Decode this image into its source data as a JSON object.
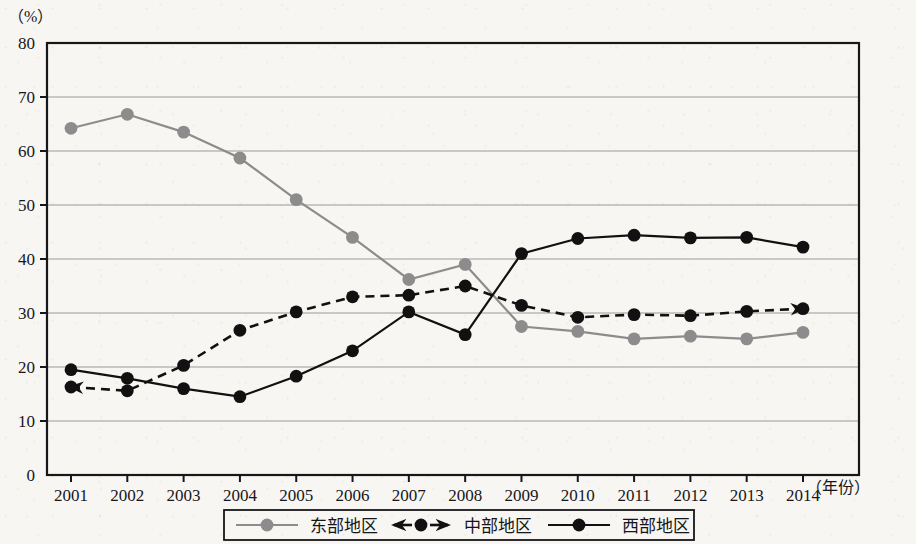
{
  "axes": {
    "y_unit": "（%）",
    "x_unit": "（年份）",
    "y_ticks": [
      "80",
      "70",
      "60",
      "50",
      "40",
      "30",
      "20",
      "10",
      "0"
    ],
    "x_ticks": [
      "2001",
      "2002",
      "2003",
      "2004",
      "2005",
      "2006",
      "2007",
      "2008",
      "2009",
      "2010",
      "2011",
      "2012",
      "2013",
      "2014"
    ]
  },
  "legend": {
    "items": [
      {
        "label": "东部地区",
        "color": "#8c8c8c",
        "style": "solid-gray-dot"
      },
      {
        "label": "中部地区",
        "color": "#111111",
        "style": "dashed-black-dot-arrows"
      },
      {
        "label": "西部地区",
        "color": "#111111",
        "style": "solid-black-dot"
      }
    ]
  },
  "colors": {
    "east": "#8c8c8c",
    "center": "#111111",
    "west": "#111111",
    "grid": "#9a9a9a",
    "frame": "#17171a",
    "paper": "#f7f6f3"
  },
  "chart_data": {
    "type": "line",
    "title": "",
    "xlabel": "年份",
    "ylabel": "%",
    "categories": [
      "2001",
      "2002",
      "2003",
      "2004",
      "2005",
      "2006",
      "2007",
      "2008",
      "2009",
      "2010",
      "2011",
      "2012",
      "2013",
      "2014"
    ],
    "ylim": [
      0,
      80
    ],
    "ytick_step": 10,
    "grid": true,
    "legend_position": "bottom",
    "series": [
      {
        "name": "东部地区",
        "color": "#8c8c8c",
        "line": "solid",
        "marker": "circle",
        "values": [
          64.2,
          66.8,
          63.5,
          58.7,
          51.0,
          44.0,
          36.2,
          39.0,
          27.5,
          26.6,
          25.2,
          25.7,
          25.2,
          26.4
        ]
      },
      {
        "name": "中部地区",
        "color": "#111111",
        "line": "dashed",
        "marker": "circle",
        "arrow_start": true,
        "arrow_end": true,
        "values": [
          16.3,
          15.6,
          20.3,
          26.8,
          30.2,
          33.0,
          33.3,
          35.0,
          31.4,
          29.2,
          29.7,
          29.5,
          30.3,
          30.8
        ]
      },
      {
        "name": "西部地区",
        "color": "#111111",
        "line": "solid",
        "marker": "circle",
        "values": [
          19.5,
          17.9,
          16.0,
          14.5,
          18.3,
          23.0,
          30.2,
          26.0,
          41.0,
          43.8,
          44.4,
          43.9,
          44.0,
          42.2
        ]
      }
    ]
  }
}
